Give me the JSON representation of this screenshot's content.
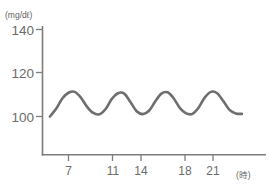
{
  "chart_data": {
    "type": "line",
    "title": "",
    "subtitle": "",
    "xlabel": "(時)",
    "ylabel": "(mg/dℓ)",
    "y_unit_label": "(mg/dℓ)",
    "x_unit_label": "(時)",
    "grid": false,
    "legend": "none",
    "xlim": [
      5,
      24
    ],
    "ylim": [
      88,
      145
    ],
    "y_ticks": [
      100,
      120,
      140
    ],
    "y_tick_labels": [
      "100",
      "120",
      "140"
    ],
    "x_ticks": [
      7,
      11,
      14,
      18,
      21
    ],
    "x_tick_labels": [
      "7",
      "11",
      "14",
      "18",
      "21"
    ],
    "series": [
      {
        "name": "blood-glucose",
        "color": "#6e6e6e",
        "x": [
          5.2,
          5.8,
          6.4,
          7.0,
          7.6,
          8.2,
          8.8,
          9.4,
          10.0,
          10.6,
          11.2,
          11.8,
          12.4,
          13.0,
          13.6,
          14.2,
          14.8,
          15.4,
          16.0,
          16.6,
          17.2,
          17.8,
          18.4,
          19.0,
          19.6,
          20.2,
          20.8,
          21.4,
          22.0,
          22.6,
          23.2,
          23.8
        ],
        "values": [
          100.0,
          103.5,
          108.2,
          110.8,
          111.2,
          108.6,
          104.4,
          101.6,
          101.0,
          103.4,
          108.0,
          110.6,
          110.4,
          106.6,
          102.4,
          101.1,
          102.6,
          106.8,
          110.4,
          111.0,
          108.2,
          103.8,
          101.4,
          101.2,
          104.0,
          108.6,
          111.2,
          110.6,
          107.0,
          103.0,
          101.4,
          101.2
        ],
        "peak_value": 111,
        "trough_value": 101,
        "start_value": 100,
        "end_value": 101
      }
    ]
  },
  "axes": {
    "y_axis_name": "y-axis",
    "x_axis_name": "x-axis",
    "axis_color": "#7d7d7d"
  }
}
